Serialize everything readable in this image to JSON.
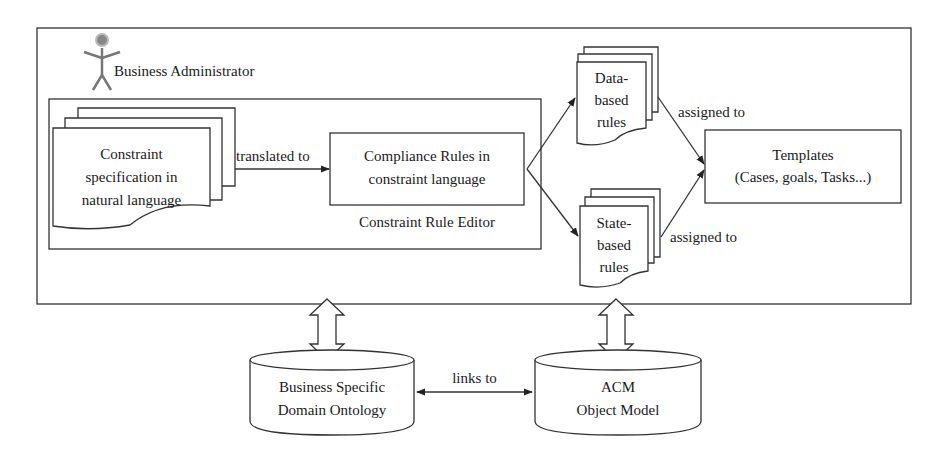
{
  "diagram": {
    "actor": {
      "label": "Business Administrator",
      "icon": "stick-figure-icon"
    },
    "constraint_spec": {
      "line1": "Constraint",
      "line2": "specification in",
      "line3": "natural language"
    },
    "translated_label": "translated to",
    "compliance_rules": {
      "line1": "Compliance Rules in",
      "line2": "constraint language"
    },
    "editor_label": "Constraint Rule Editor",
    "data_rules": {
      "line1": "Data-",
      "line2": "based",
      "line3": "rules"
    },
    "state_rules": {
      "line1": "State-",
      "line2": "based",
      "line3": "rules"
    },
    "assigned_top": "assigned to",
    "assigned_bottom": "assigned to",
    "templates": {
      "line1": "Templates",
      "line2": "(Cases, goals, Tasks...)"
    },
    "ontology": {
      "line1": "Business Specific",
      "line2": "Domain Ontology"
    },
    "acm": {
      "line1": "ACM",
      "line2": "Object Model"
    },
    "links_label": "links to"
  }
}
